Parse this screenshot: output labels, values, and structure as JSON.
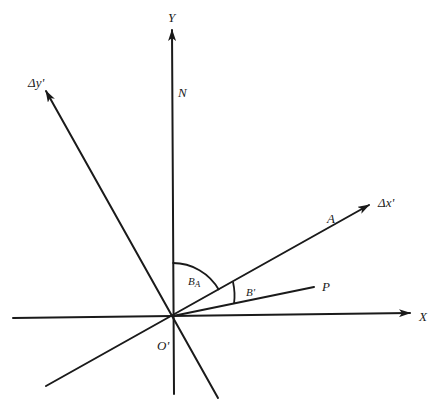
{
  "diagram": {
    "type": "coordinate-rotation-diagram",
    "origin": {
      "label": "O'",
      "x": 173,
      "y": 316
    },
    "axes": [
      {
        "id": "y-axis",
        "label": "Y",
        "from": [
          174,
          394
        ],
        "to": [
          172,
          28
        ],
        "arrow": true
      },
      {
        "id": "x-axis",
        "label": "X",
        "from": [
          13,
          318
        ],
        "to": [
          410,
          313
        ],
        "arrow": true
      },
      {
        "id": "dy-prime-axis",
        "label": "Δy'",
        "from": [
          218,
          398
        ],
        "to": [
          45,
          90
        ],
        "arrow": true
      },
      {
        "id": "dx-prime-axis",
        "label": "Δx'",
        "from": [
          46,
          386
        ],
        "to": [
          370,
          204
        ],
        "arrow": true
      },
      {
        "id": "p-line",
        "label": "P",
        "from": [
          173,
          316
        ],
        "to": [
          314,
          287
        ],
        "arrow": false
      }
    ],
    "labels": {
      "y": "Y",
      "n": "N",
      "dy_prime": "Δy'",
      "a": "A",
      "dx_prime": "Δx'",
      "b_a_main": "B",
      "b_a_sub": "A",
      "b_prime": "B'",
      "p": "P",
      "x": "X",
      "origin": "O'"
    },
    "angles": [
      {
        "label": "B_A",
        "between": [
          "N (Y axis)",
          "A (Δx' axis)"
        ]
      },
      {
        "label": "B'",
        "between": [
          "A (Δx' axis)",
          "P"
        ]
      }
    ]
  }
}
